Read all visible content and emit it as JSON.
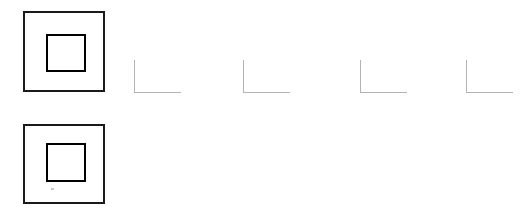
{
  "canvas": {
    "width": 521,
    "height": 213,
    "background_color": "#ffffff",
    "description": "Line drawing canvas with two concentric square figures and four L-shaped corner marks"
  },
  "palette": {
    "stroke_black": "#1a1a1a",
    "stroke_gray": "#b3b3b3",
    "speck_gray": "#c9c9c9",
    "background": "#ffffff"
  },
  "figures": [
    {
      "id": "concentric-square-top",
      "label": "Concentric square (top)",
      "stroke_color": "#1a1a1a",
      "outer": {
        "x": 23,
        "y": 11,
        "width": 82,
        "height": 81,
        "stroke_width": 2
      },
      "inner": {
        "x": 21,
        "y": 21,
        "width": 40,
        "height": 38,
        "stroke_width": 2
      },
      "speck": null
    },
    {
      "id": "concentric-square-bottom",
      "label": "Concentric square (bottom)",
      "stroke_color": "#1a1a1a",
      "outer": {
        "x": 23,
        "y": 124,
        "width": 82,
        "height": 80,
        "stroke_width": 2
      },
      "inner": {
        "x": 21,
        "y": 17,
        "width": 40,
        "height": 39,
        "stroke_width": 2
      },
      "speck": {
        "x": 26,
        "y": 62,
        "width": 3,
        "height": 2,
        "color": "#c9c9c9"
      }
    }
  ],
  "corner_marks": [
    {
      "id": "corner-mark-1",
      "label": "L-shaped corner mark 1",
      "x": 134,
      "y": 60,
      "width": 47,
      "height": 33,
      "stroke_width": 1,
      "stroke_color": "#b3b3b3"
    },
    {
      "id": "corner-mark-2",
      "label": "L-shaped corner mark 2",
      "x": 243,
      "y": 60,
      "width": 47,
      "height": 33,
      "stroke_width": 1,
      "stroke_color": "#b3b3b3"
    },
    {
      "id": "corner-mark-3",
      "label": "L-shaped corner mark 3",
      "x": 360,
      "y": 60,
      "width": 47,
      "height": 33,
      "stroke_width": 1,
      "stroke_color": "#b3b3b3"
    },
    {
      "id": "corner-mark-4",
      "label": "L-shaped corner mark 4",
      "x": 466,
      "y": 60,
      "width": 47,
      "height": 33,
      "stroke_width": 1,
      "stroke_color": "#b3b3b3"
    }
  ]
}
